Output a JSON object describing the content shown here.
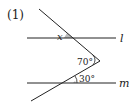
{
  "problem_label": "(1)",
  "lines": {
    "top": "l",
    "bottom": "m"
  },
  "angles": {
    "unknown": "x",
    "vertex": "70°",
    "bottom": "30°"
  },
  "colors": {
    "stroke": "#222222",
    "shade": "#bbbbbb"
  }
}
